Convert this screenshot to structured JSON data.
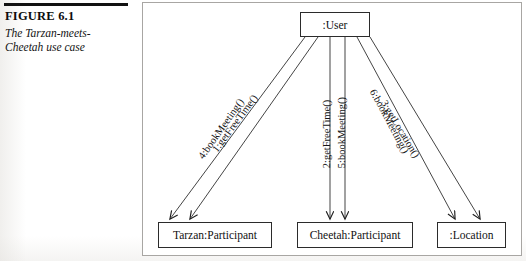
{
  "caption": {
    "figure_number": "FIGURE 6.1",
    "figure_title": "The Tarzan-meets-Cheetah use case"
  },
  "diagram": {
    "type": "uml-collaboration-diagram",
    "objects": [
      {
        "id": "user",
        "label": ":User"
      },
      {
        "id": "tarzan",
        "label": "Tarzan:Participant"
      },
      {
        "id": "cheetah",
        "label": "Cheetah:Participant"
      },
      {
        "id": "location",
        "label": ":Location"
      }
    ],
    "messages": [
      {
        "sequence": "1",
        "label": "1:getFreeTime()",
        "from": "user",
        "to": "tarzan"
      },
      {
        "sequence": "2",
        "label": "2:getFreeTime()",
        "from": "user",
        "to": "cheetah"
      },
      {
        "sequence": "3",
        "label": "3:getLocation()",
        "from": "user",
        "to": "location"
      },
      {
        "sequence": "4",
        "label": "4:bookMeeting()",
        "from": "user",
        "to": "tarzan"
      },
      {
        "sequence": "5",
        "label": "5:bookMeeting()",
        "from": "user",
        "to": "cheetah"
      },
      {
        "sequence": "6",
        "label": "6:bookMeeting()",
        "from": "user",
        "to": "location"
      }
    ]
  },
  "colors": {
    "ink": "#111111",
    "box_border": "#2b2b2b",
    "frame_border": "#a8a6a3",
    "rule": "#121212",
    "page": "#ffffff"
  }
}
